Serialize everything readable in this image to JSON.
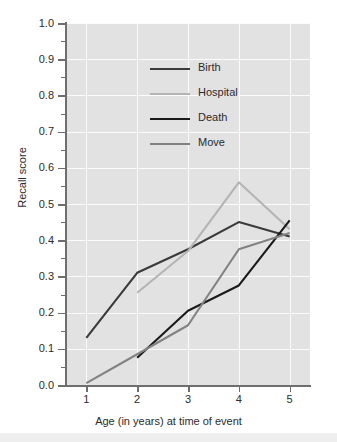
{
  "chart_data": {
    "type": "line",
    "title": "",
    "xlabel": "Age (in years) at time of event",
    "ylabel": "Recall score",
    "x": [
      1,
      2,
      3,
      4,
      5
    ],
    "xtick_labels": [
      "1",
      "2",
      "3",
      "4",
      "5"
    ],
    "ytick_labels": [
      "0.0",
      "0.1",
      "0.2",
      "0.3",
      "0.4",
      "0.5",
      "0.6",
      "0.7",
      "0.8",
      "0.9",
      "1.0"
    ],
    "ytick_values": [
      0.0,
      0.1,
      0.2,
      0.3,
      0.4,
      0.5,
      0.6,
      0.7,
      0.8,
      0.9,
      1.0
    ],
    "xlim": [
      0.6,
      5.4
    ],
    "ylim": [
      0.0,
      1.0
    ],
    "grid": true,
    "grid_color": "#fbfbfb",
    "panel_color": "#e2e2e2",
    "legend_position": "upper-center",
    "series": [
      {
        "name": "Birth",
        "color": "#3a3a3a",
        "x": [
          1,
          2,
          3,
          4,
          5
        ],
        "values": [
          0.13,
          0.31,
          0.375,
          0.45,
          0.41
        ]
      },
      {
        "name": "Hospital",
        "color": "#b4b4b4",
        "x": [
          2,
          3,
          4,
          5
        ],
        "values": [
          0.255,
          0.37,
          0.56,
          0.43
        ]
      },
      {
        "name": "Death",
        "color": "#1a1a1a",
        "x": [
          2,
          3,
          4,
          5
        ],
        "values": [
          0.075,
          0.205,
          0.275,
          0.455
        ]
      },
      {
        "name": "Move",
        "color": "#828282",
        "x": [
          1,
          2,
          3,
          4,
          5
        ],
        "values": [
          0.005,
          0.085,
          0.165,
          0.375,
          0.42
        ]
      }
    ]
  },
  "legend": {
    "items": [
      {
        "label": "Birth",
        "color": "#3a3a3a"
      },
      {
        "label": "Hospital",
        "color": "#b4b4b4"
      },
      {
        "label": "Death",
        "color": "#1a1a1a"
      },
      {
        "label": "Move",
        "color": "#828282"
      }
    ]
  }
}
